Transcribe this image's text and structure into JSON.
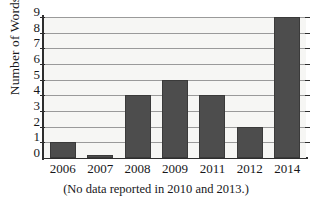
{
  "chart_data": {
    "type": "bar",
    "title": "",
    "xlabel": "",
    "ylabel": "Number of Words",
    "categories": [
      "2006",
      "2007",
      "2008",
      "2009",
      "2011",
      "2012",
      "2014"
    ],
    "values": [
      1,
      0,
      4,
      5,
      4,
      2,
      9
    ],
    "ylim": [
      0,
      9
    ],
    "yticks": [
      0,
      1,
      2,
      3,
      4,
      5,
      6,
      7,
      8,
      9
    ],
    "ytick_labels": [
      "0",
      "1",
      "2",
      "3",
      "4",
      "5",
      "6",
      "7",
      "8",
      "9"
    ],
    "grid": true,
    "legend": "none",
    "annotation": "(No data reported in 2010 and 2013.)",
    "bar_color": "#4d4d4d",
    "grid_color": "#9a9a9a",
    "axis_color": "#2e2e2e",
    "plot_background": "#f6f6f4"
  },
  "axes": {
    "y_title": "Number of Words"
  },
  "caption": {
    "text": "(No data reported in 2010 and 2013.)"
  }
}
